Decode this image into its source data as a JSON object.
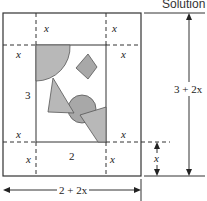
{
  "header": {
    "title": "Solution"
  },
  "labels": {
    "margin": "x",
    "inner_height": "3",
    "inner_width": "2",
    "total_height": "3 + 2x",
    "total_width": "2 + 2x",
    "bottom_margin_dim": "x"
  },
  "colors": {
    "line": "#333333",
    "shape_fill": "#b8b8b8",
    "shape_fill_dark": "#a8a8a8",
    "shape_stroke": "#555555"
  }
}
